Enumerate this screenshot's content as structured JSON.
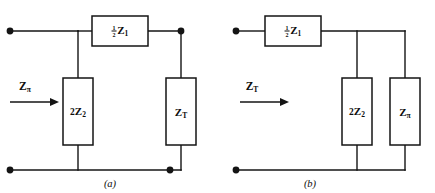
{
  "figure": {
    "type": "two-part circuit schematic",
    "background_color": "#ffffff",
    "line_color": "#141414",
    "panels": [
      {
        "id": "a",
        "caption": "(a)",
        "port_label": {
          "symbol": "Z",
          "subscript": "π",
          "display": "Zπ",
          "arrow": "right-arrow"
        },
        "components": [
          {
            "id": "series-half-z1",
            "orientation": "horizontal",
            "position": "top-rail-series",
            "label_prefix": "",
            "label_fraction_numerator": "1",
            "label_fraction_denominator": "2",
            "label_symbol": "Z",
            "label_subscript": "1",
            "display": "½Z₁"
          },
          {
            "id": "shunt-2z2",
            "orientation": "vertical",
            "position": "left-shunt",
            "label_prefix": "2",
            "label_symbol": "Z",
            "label_subscript": "2",
            "display": "2Z₂"
          },
          {
            "id": "shunt-zt",
            "orientation": "vertical",
            "position": "right-shunt",
            "label_prefix": "",
            "label_symbol": "Z",
            "label_subscript": "T",
            "display": "Zₜ"
          }
        ],
        "node_dots": 4
      },
      {
        "id": "b",
        "caption": "(b)",
        "port_label": {
          "symbol": "Z",
          "subscript": "T",
          "display": "ZT",
          "arrow": "right-arrow"
        },
        "components": [
          {
            "id": "series-half-z1",
            "orientation": "horizontal",
            "position": "top-rail-series",
            "label_prefix": "",
            "label_fraction_numerator": "1",
            "label_fraction_denominator": "2",
            "label_symbol": "Z",
            "label_subscript": "1",
            "display": "½Z₁"
          },
          {
            "id": "shunt-2z2",
            "orientation": "vertical",
            "position": "middle-shunt",
            "label_prefix": "2",
            "label_symbol": "Z",
            "label_subscript": "2",
            "display": "2Z₂"
          },
          {
            "id": "shunt-zpi",
            "orientation": "vertical",
            "position": "right-shunt",
            "label_prefix": "",
            "label_symbol": "Z",
            "label_subscript": "π",
            "display": "Zπ"
          }
        ],
        "node_dots": 2
      }
    ]
  },
  "labels": {
    "panel_a_port_symbol": "Z",
    "panel_a_port_sub": "π",
    "panel_a_series_sym": "Z",
    "panel_a_series_sub": "1",
    "panel_a_series_num": "1",
    "panel_a_series_den": "2",
    "panel_a_left_shunt_pre": "2",
    "panel_a_left_shunt_sym": "Z",
    "panel_a_left_shunt_sub": "2",
    "panel_a_right_shunt_sym": "Z",
    "panel_a_right_shunt_sub": "T",
    "panel_a_caption": "(a)",
    "panel_b_port_symbol": "Z",
    "panel_b_port_sub": "T",
    "panel_b_series_sym": "Z",
    "panel_b_series_sub": "1",
    "panel_b_series_num": "1",
    "panel_b_series_den": "2",
    "panel_b_mid_shunt_pre": "2",
    "panel_b_mid_shunt_sym": "Z",
    "panel_b_mid_shunt_sub": "2",
    "panel_b_right_shunt_sym": "Z",
    "panel_b_right_shunt_sub": "π",
    "panel_b_caption": "(b)"
  }
}
